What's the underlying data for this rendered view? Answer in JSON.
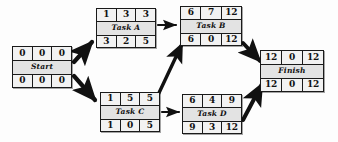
{
  "diagram": {
    "type": "activity-on-node-network",
    "background_color": "#fdfdfd",
    "node_fill": "#e8e8e8",
    "stroke_color": "#1a1a1a",
    "cell_legend": {
      "top_row": [
        "early-start",
        "duration",
        "early-finish"
      ],
      "bottom_row": [
        "late-start",
        "slack",
        "late-finish"
      ]
    },
    "nodes": [
      {
        "id": "start",
        "label": "Start",
        "top": [
          "0",
          "0",
          "0"
        ],
        "bottom": [
          "0",
          "0",
          "0"
        ],
        "x": 12,
        "y": 46,
        "w": 60,
        "h": 42
      },
      {
        "id": "task-a",
        "label": "Task A",
        "top": [
          "1",
          "3",
          "3"
        ],
        "bottom": [
          "3",
          "2",
          "5"
        ],
        "x": 96,
        "y": 8,
        "w": 60,
        "h": 40
      },
      {
        "id": "task-b",
        "label": "Task B",
        "top": [
          "6",
          "7",
          "12"
        ],
        "bottom": [
          "6",
          "0",
          "12"
        ],
        "x": 180,
        "y": 6,
        "w": 62,
        "h": 40
      },
      {
        "id": "task-c",
        "label": "Task C",
        "top": [
          "1",
          "5",
          "5"
        ],
        "bottom": [
          "1",
          "0",
          "5"
        ],
        "x": 100,
        "y": 92,
        "w": 60,
        "h": 40
      },
      {
        "id": "task-d",
        "label": "Task D",
        "top": [
          "6",
          "4",
          "9"
        ],
        "bottom": [
          "9",
          "3",
          "12"
        ],
        "x": 182,
        "y": 94,
        "w": 60,
        "h": 40
      },
      {
        "id": "finish",
        "label": "Finish",
        "top": [
          "12",
          "0",
          "12"
        ],
        "bottom": [
          "12",
          "0",
          "12"
        ],
        "x": 260,
        "y": 50,
        "w": 64,
        "h": 42
      }
    ],
    "edges": [
      {
        "id": "start-to-task-a",
        "from": "start",
        "to": "task-a",
        "style": "thick"
      },
      {
        "id": "start-to-task-c",
        "from": "start",
        "to": "task-c",
        "style": "thick"
      },
      {
        "id": "task-a-to-task-b",
        "from": "task-a",
        "to": "task-b",
        "style": "thin"
      },
      {
        "id": "task-c-to-task-b",
        "from": "task-c",
        "to": "task-b",
        "style": "thick"
      },
      {
        "id": "task-c-to-task-d",
        "from": "task-c",
        "to": "task-d",
        "style": "thin"
      },
      {
        "id": "task-b-to-finish",
        "from": "task-b",
        "to": "finish",
        "style": "thick"
      },
      {
        "id": "task-d-to-finish",
        "from": "task-d",
        "to": "finish",
        "style": "thick"
      }
    ]
  }
}
